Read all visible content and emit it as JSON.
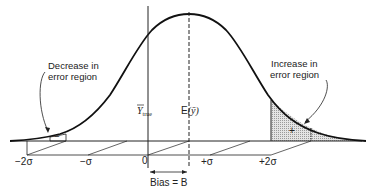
{
  "diagram": {
    "title": "",
    "annotations": {
      "decrease_line1": "Decrease in",
      "decrease_line2": "error region",
      "increase_line1": "Increase in",
      "increase_line2": "error region",
      "minus_sign": "−",
      "plus_sign": "+"
    },
    "markers": {
      "y_true": "Y",
      "y_true_sub": "true",
      "expected": "E",
      "expected_arg": "(ȳ)"
    },
    "axis_ticks": {
      "minus_2sigma": "−2σ",
      "minus_sigma": "−σ",
      "zero": "0",
      "plus_sigma": "+σ",
      "plus_2sigma": "+2σ"
    },
    "bias_label": "Bias = B",
    "colors": {
      "ink": "#222222",
      "shade": "#c8c8c8",
      "background": "#ffffff"
    }
  }
}
